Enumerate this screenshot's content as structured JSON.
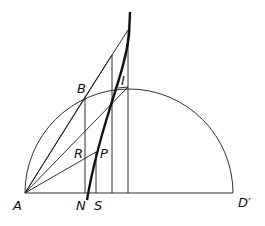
{
  "diagram": {
    "type": "geometric construction",
    "labels": {
      "A": "A",
      "B": "B",
      "I": "I",
      "R": "R",
      "P": "P",
      "N": "N",
      "S": "S",
      "D": "D′"
    },
    "colors": {
      "stroke": "#1a1a1a",
      "background": "#ffffff"
    }
  }
}
